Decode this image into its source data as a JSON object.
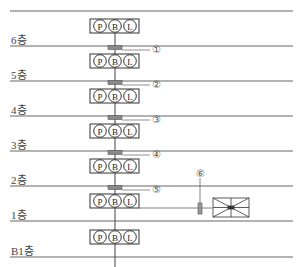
{
  "diagram": {
    "type": "building riser diagram",
    "floors": [
      {
        "label": "6층",
        "line_y": 46,
        "label_y": 34
      },
      {
        "label": "5층",
        "line_y": 81,
        "label_y": 69
      },
      {
        "label": "4층",
        "line_y": 116,
        "label_y": 104
      },
      {
        "label": "3층",
        "line_y": 151,
        "label_y": 139
      },
      {
        "label": "2층",
        "line_y": 186,
        "label_y": 174
      },
      {
        "label": "1층",
        "line_y": 221,
        "label_y": 209
      },
      {
        "label": "B1층",
        "line_y": 257,
        "label_y": 245
      }
    ],
    "top_line_y": 11,
    "panel_letters": [
      "P",
      "B",
      "L"
    ],
    "panel_count": 7,
    "markers": [
      {
        "label": "①",
        "id": 1
      },
      {
        "label": "②",
        "id": 2
      },
      {
        "label": "③",
        "id": 3
      },
      {
        "label": "④",
        "id": 4
      },
      {
        "label": "⑤",
        "id": 5
      },
      {
        "label": "⑥",
        "id": 6
      }
    ],
    "equipment": "distribution-box",
    "colors": {
      "line": "#555555",
      "sleeve_fill": "#8a8a8a",
      "panel_stroke": "#333333",
      "background": "#ffffff"
    }
  }
}
